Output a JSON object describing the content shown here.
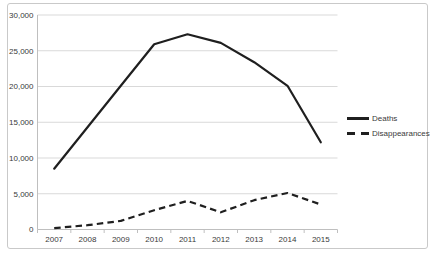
{
  "chart_data": {
    "type": "line",
    "title": "",
    "categories": [
      "2007",
      "2008",
      "2009",
      "2010",
      "2011",
      "2012",
      "2013",
      "2014",
      "2015"
    ],
    "series": [
      {
        "name": "Deaths",
        "style": "solid",
        "values": [
          8500,
          14300,
          20100,
          25900,
          27300,
          26100,
          23400,
          20100,
          12200
        ]
      },
      {
        "name": "Disappearances",
        "style": "dashed",
        "values": [
          200,
          600,
          1200,
          2700,
          4000,
          2400,
          4100,
          5100,
          3500
        ]
      }
    ],
    "xlabel": "",
    "ylabel": "",
    "ylim": [
      0,
      30000
    ],
    "yticks": [
      {
        "value": 0,
        "label": "0"
      },
      {
        "value": 5000,
        "label": "5,000"
      },
      {
        "value": 10000,
        "label": "10,000"
      },
      {
        "value": 15000,
        "label": "15,000"
      },
      {
        "value": 20000,
        "label": "20,000"
      },
      {
        "value": 25000,
        "label": "25,000"
      },
      {
        "value": 30000,
        "label": "30,000"
      }
    ],
    "grid": true,
    "legend_position": "right",
    "colors": {
      "line": "#1f1f1f",
      "grid": "#d9d9d9",
      "axis": "#bfbfbf",
      "text": "#3a3a3a",
      "frame": "#c9c9c9",
      "background": "#ffffff"
    }
  }
}
